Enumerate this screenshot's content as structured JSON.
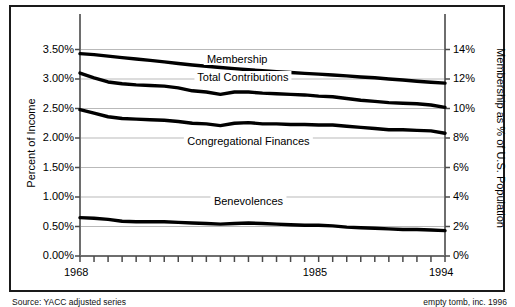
{
  "figure": {
    "source_note_left": "Source: YACC adjusted series",
    "source_note_right": "empty tomb, inc. 1996"
  },
  "chart_data": {
    "type": "line",
    "title": "",
    "xlabel": "",
    "ylabel": "Percent of Income",
    "y2label": "Membership as % of U.S. Population",
    "grid": true,
    "legend": "inline-labels",
    "xlim": [
      1968,
      1994
    ],
    "ylim": [
      0.0,
      4.0
    ],
    "y2lim": [
      0,
      16
    ],
    "left_axis": {
      "label": "Percent of Income",
      "ticks": [
        "0.00%",
        "0.50%",
        "1.00%",
        "1.50%",
        "2.00%",
        "2.50%",
        "3.00%",
        "3.50%"
      ],
      "tick_values": [
        0.0,
        0.5,
        1.0,
        1.5,
        2.0,
        2.5,
        3.0,
        3.5
      ],
      "min": 0.0,
      "max": 4.0
    },
    "right_axis": {
      "label": "Membership as % of U.S. Population",
      "ticks": [
        "0%",
        "2%",
        "4%",
        "6%",
        "8%",
        "10%",
        "12%",
        "14%"
      ],
      "tick_values": [
        0,
        2,
        4,
        6,
        8,
        10,
        12,
        14
      ],
      "min": 0,
      "max": 16
    },
    "x_ticks_labeled": [
      "1968",
      "1985",
      "1994"
    ],
    "x_tick_values_labeled": [
      1968,
      1985,
      1994
    ],
    "x": [
      1968,
      1969,
      1970,
      1971,
      1972,
      1973,
      1974,
      1975,
      1976,
      1977,
      1978,
      1979,
      1980,
      1981,
      1982,
      1983,
      1984,
      1985,
      1986,
      1987,
      1988,
      1989,
      1990,
      1991,
      1992,
      1993,
      1994
    ],
    "series": [
      {
        "name": "Membership",
        "axis": "right",
        "unit": "% of U.S. population",
        "values": [
          13.72,
          13.65,
          13.55,
          13.45,
          13.36,
          13.26,
          13.16,
          13.05,
          12.95,
          12.86,
          12.78,
          12.7,
          12.63,
          12.56,
          12.5,
          12.44,
          12.38,
          12.33,
          12.27,
          12.21,
          12.14,
          12.08,
          12.0,
          11.93,
          11.85,
          11.78,
          11.72
        ]
      },
      {
        "name": "Total Contributions",
        "axis": "left",
        "unit": "% of income",
        "values": [
          3.1,
          3.02,
          2.95,
          2.92,
          2.9,
          2.89,
          2.88,
          2.85,
          2.8,
          2.78,
          2.74,
          2.78,
          2.78,
          2.76,
          2.75,
          2.74,
          2.73,
          2.71,
          2.7,
          2.67,
          2.64,
          2.62,
          2.6,
          2.59,
          2.58,
          2.56,
          2.52
        ]
      },
      {
        "name": "Congregational Finances",
        "axis": "left",
        "unit": "% of income",
        "values": [
          2.48,
          2.42,
          2.36,
          2.33,
          2.32,
          2.31,
          2.3,
          2.28,
          2.25,
          2.24,
          2.21,
          2.25,
          2.26,
          2.24,
          2.24,
          2.23,
          2.23,
          2.22,
          2.22,
          2.2,
          2.18,
          2.16,
          2.14,
          2.14,
          2.13,
          2.12,
          2.08
        ]
      },
      {
        "name": "Benevolences",
        "axis": "left",
        "unit": "% of income",
        "values": [
          0.65,
          0.64,
          0.62,
          0.59,
          0.58,
          0.58,
          0.58,
          0.57,
          0.56,
          0.55,
          0.54,
          0.55,
          0.56,
          0.55,
          0.54,
          0.53,
          0.52,
          0.52,
          0.51,
          0.49,
          0.48,
          0.47,
          0.46,
          0.45,
          0.45,
          0.44,
          0.43
        ]
      }
    ],
    "series_label_positions": [
      {
        "name": "Membership",
        "x": 1979.2,
        "y_axis": "right",
        "y": 13.3
      },
      {
        "name": "Total Contributions",
        "x": 1979.6,
        "y_axis": "left",
        "y": 3.02
      },
      {
        "name": "Congregational Finances",
        "x": 1980.0,
        "y_axis": "left",
        "y": 1.94
      },
      {
        "name": "Benevolences",
        "x": 1980.0,
        "y_axis": "left",
        "y": 0.92
      }
    ]
  }
}
